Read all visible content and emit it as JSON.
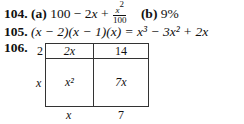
{
  "problems": [
    {
      "number": "104.",
      "part_a_label": "(a)",
      "part_a_expr_start": "100 − 2",
      "part_a_var": "x",
      "part_a_plus": " + ",
      "part_a_frac_num_var": "x",
      "part_a_frac_num_exp": "2",
      "part_a_frac_den": "100",
      "part_b_label": "(b)",
      "part_b_value": "9%"
    },
    {
      "number": "105.",
      "expression": "(x − 2)(x − 1)(x) = x³ − 3x² + 2x"
    },
    {
      "number": "106.",
      "area_model": {
        "row_labels": [
          "2",
          "x"
        ],
        "col_labels": [
          "x",
          "7"
        ],
        "cells": [
          [
            "2x",
            "14"
          ],
          [
            "x²",
            "7x"
          ]
        ]
      }
    }
  ]
}
